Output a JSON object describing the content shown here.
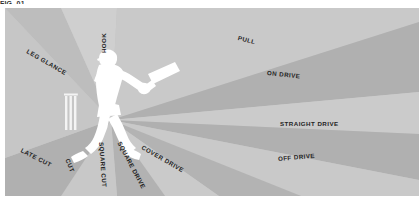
{
  "top_caption": {
    "text": "FIG. 01"
  },
  "diagram": {
    "field_color": "#c4c4c4",
    "sector_light_color": "#cecece",
    "sector_mid_color": "#bdbdbd",
    "sector_dark_color": "#ababab",
    "player_color": "#ffffff",
    "stumps_color": "#f2f2f2",
    "label_color": "#242424",
    "origin": {
      "x": 106,
      "y": 112
    },
    "shots": [
      {
        "name": "leg-glance",
        "label": "LEG GLANCE",
        "x": 22,
        "y": 40,
        "rotate": 30
      },
      {
        "name": "hook",
        "label": "HOOK",
        "x": 99,
        "y": 42,
        "rotate": -90
      },
      {
        "name": "pull",
        "label": "PULL",
        "x": 233,
        "y": 27,
        "rotate": 14
      },
      {
        "name": "on-drive",
        "label": "ON DRIVE",
        "x": 262,
        "y": 62,
        "rotate": 6
      },
      {
        "name": "straight-drive",
        "label": "STRAIGHT DRIVE",
        "x": 275,
        "y": 113,
        "rotate": 0
      },
      {
        "name": "off-drive",
        "label": "OFF DRIVE",
        "x": 273,
        "y": 148,
        "rotate": -5
      },
      {
        "name": "cover-drive",
        "label": "COVER DRIVE",
        "x": 137,
        "y": 136,
        "rotate": 30
      },
      {
        "name": "square-drive",
        "label": "SQUARE DRIVE",
        "x": 114,
        "y": 131,
        "rotate": 62
      },
      {
        "name": "square-cut",
        "label": "SQUARE CUT",
        "x": 96,
        "y": 131,
        "rotate": 86
      },
      {
        "name": "cut",
        "label": "CUT",
        "x": 62,
        "y": 148,
        "rotate": 67
      },
      {
        "name": "late-cut",
        "label": "LATE CUT",
        "x": 16,
        "y": 139,
        "rotate": 27
      }
    ],
    "batsman": {
      "name": "batsman-silhouette",
      "description": "right-handed batsman playing a drive"
    },
    "stumps": {
      "name": "stumps",
      "count": 3
    }
  }
}
